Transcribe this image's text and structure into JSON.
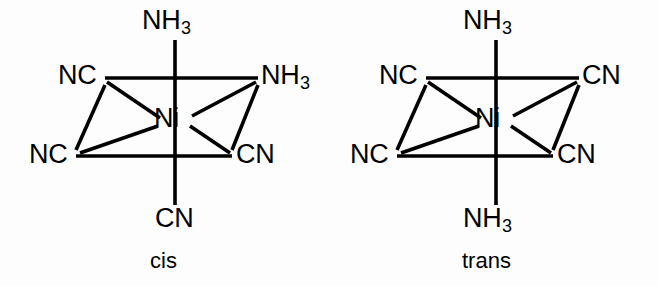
{
  "figure": {
    "background_color": "#fdfdfd",
    "ink_color": "#000000"
  },
  "structures": [
    {
      "id": "cis",
      "name_label": "cis",
      "metal_center": "Ni",
      "vertices": [
        {
          "position": "axial-top",
          "label_html": "NH<sub>3</sub>",
          "label_text": "NH3"
        },
        {
          "position": "equatorial-back-left",
          "label_html": "NC",
          "label_text": "NC"
        },
        {
          "position": "equatorial-back-right",
          "label_html": "NH<sub>3</sub>",
          "label_text": "NH3"
        },
        {
          "position": "equatorial-front-left",
          "label_html": "NC",
          "label_text": "NC"
        },
        {
          "position": "equatorial-front-right",
          "label_html": "CN",
          "label_text": "CN"
        },
        {
          "position": "axial-bottom",
          "label_html": "CN",
          "label_text": "CN"
        }
      ]
    },
    {
      "id": "trans",
      "name_label": "trans",
      "metal_center": "Ni",
      "vertices": [
        {
          "position": "axial-top",
          "label_html": "NH<sub>3</sub>",
          "label_text": "NH3"
        },
        {
          "position": "equatorial-back-left",
          "label_html": "NC",
          "label_text": "NC"
        },
        {
          "position": "equatorial-back-right",
          "label_html": "CN",
          "label_text": "CN"
        },
        {
          "position": "equatorial-front-left",
          "label_html": "NC",
          "label_text": "NC"
        },
        {
          "position": "equatorial-front-right",
          "label_html": "CN",
          "label_text": "CN"
        },
        {
          "position": "axial-bottom",
          "label_html": "NH<sub>3</sub>",
          "label_text": "NH3"
        }
      ]
    }
  ]
}
